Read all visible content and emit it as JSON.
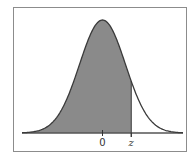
{
  "chart_data": {
    "type": "area",
    "title": "",
    "xlabel": "",
    "ylabel": "",
    "tick_labels": [
      "0",
      "z"
    ],
    "x_range": [
      -3.5,
      3.5
    ],
    "mean": 0,
    "sd": 1,
    "z_value": 1.25,
    "shaded_region": "left of z",
    "grid": false,
    "legend": null
  },
  "colors": {
    "frame": "#8c8c8c",
    "curve": "#3a3a3a",
    "fill": "#8a8a8a",
    "axis": "#555555",
    "text": "#333333"
  }
}
